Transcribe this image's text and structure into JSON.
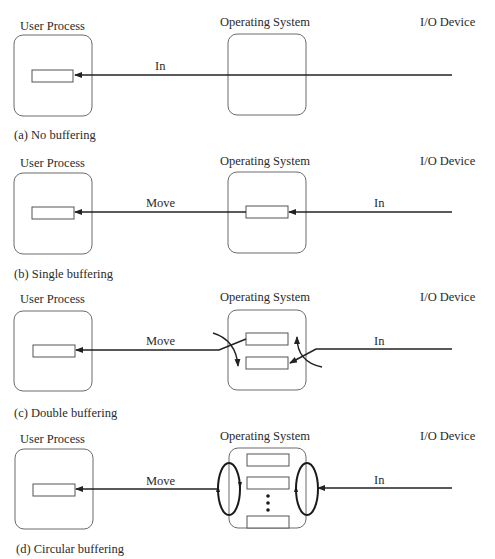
{
  "labels": {
    "user_process": "User Process",
    "operating_system": "Operating System",
    "io_device": "I/O Device"
  },
  "panels": [
    {
      "id": "a",
      "caption": "(a) No buffering",
      "flows": {
        "left": "",
        "right": "In"
      }
    },
    {
      "id": "b",
      "caption": "(b) Single buffering",
      "flows": {
        "left": "Move",
        "right": "In"
      }
    },
    {
      "id": "c",
      "caption": "(c) Double buffering",
      "flows": {
        "left": "Move",
        "right": "In"
      }
    },
    {
      "id": "d",
      "caption": "(d) Circular buffering",
      "flows": {
        "left": "Move",
        "right": "In"
      }
    }
  ]
}
